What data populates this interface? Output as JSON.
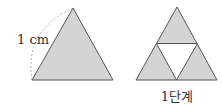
{
  "figures": [
    {
      "name": "original-triangle",
      "side_label": "1 cm",
      "fill": "#d4d4d4",
      "stroke": "#555555"
    },
    {
      "name": "stage-1-triangle",
      "caption": "1단계",
      "fill": "#d4d4d4",
      "hole_fill": "#ffffff",
      "stroke": "#555555"
    }
  ]
}
